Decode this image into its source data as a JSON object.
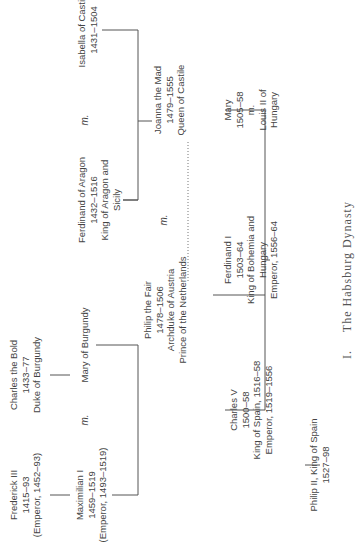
{
  "title": "The Habsburg Dynasty",
  "caption_number": "I.",
  "marriage_label": "m.",
  "people": {
    "frederick_iii": {
      "name": "Frederick III",
      "dates": "1415–93",
      "note": "(Emperor, 1452–93)"
    },
    "charles_the_bold": {
      "name": "Charles the Bold",
      "dates": "1433–77",
      "note": "Duke of Burgundy"
    },
    "maximilian_i": {
      "name": "Maximilian I",
      "dates": "1459–1519",
      "note": "(Emperor, 1493–1519)"
    },
    "mary_of_burgundy": {
      "name": "Mary of Burgundy"
    },
    "ferdinand_of_aragon": {
      "name": "Ferdinand of Aragon",
      "dates": "1432–1516",
      "note1": "King of Aragon and",
      "note2": "Sicily"
    },
    "isabella_of_castile": {
      "name": "Isabella of Castile",
      "dates": "1431–1504"
    },
    "philip_the_fair": {
      "name": "Philip the Fair",
      "dates": "1478–1506",
      "note1": "Archduke of Austria",
      "note2": "Prince of the Netherlands"
    },
    "joanna_the_mad": {
      "name": "Joanna the Mad",
      "dates": "1479–1555",
      "note": "Queen of Castile"
    },
    "charles_v": {
      "name": "Charles V",
      "dates": "1500–58",
      "note1": "King of Spain, 1516–58",
      "note2": "Emperor, 1519–1556"
    },
    "ferdinand_i": {
      "name": "Ferdinand I",
      "dates": "1503–64",
      "note1": "King of Bohemia and",
      "note2": "Hungary",
      "note3": "Emperor, 1556–64"
    },
    "mary_hungary": {
      "name": "Mary",
      "dates": "1505–58",
      "marriage": "m.",
      "spouse1": "Louis II of",
      "spouse2": "Hungary"
    },
    "philip_ii": {
      "name": "Philip II, King of Spain",
      "dates": "1527–98"
    }
  }
}
